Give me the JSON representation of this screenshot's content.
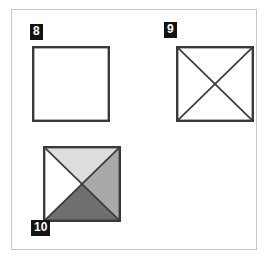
{
  "figure": {
    "panel_background": "#ffffff",
    "panel_border_color": "#c9c9c9",
    "label_background": "#131313",
    "label_text_color": "#ffffff",
    "stroke_color": "#3a3a3a"
  },
  "items": [
    {
      "label": "8",
      "label_position": "above-left",
      "shape": "square",
      "diagonals": "none",
      "fills": {
        "top": "#ffffff",
        "left": "#ffffff",
        "right": "#ffffff",
        "bottom": "#ffffff"
      }
    },
    {
      "label": "9",
      "label_position": "above-left",
      "shape": "square",
      "diagonals": "both",
      "fills": {
        "top": "#ffffff",
        "left": "#ffffff",
        "right": "#ffffff",
        "bottom": "#ffffff"
      }
    },
    {
      "label": "10",
      "label_position": "below-left",
      "shape": "square",
      "diagonals": "both",
      "fills": {
        "top": "#dddddd",
        "left": "#ffffff",
        "right": "#a9a9a9",
        "bottom": "#6f6f6f"
      }
    }
  ]
}
